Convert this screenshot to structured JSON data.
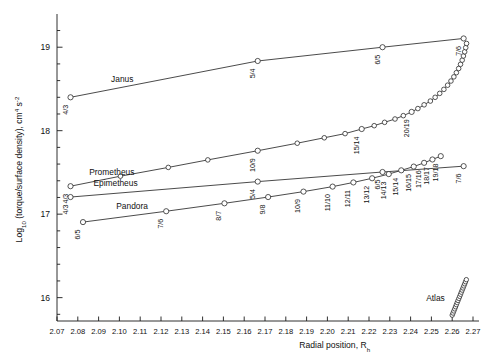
{
  "chart_data": {
    "type": "line",
    "title": "",
    "xlabel": "Radial position, R",
    "xlabel_sub": "h",
    "ylabel_main": "Log",
    "ylabel_sub": "10",
    "ylabel_rest": " (torque/surface density), cm",
    "ylabel_sup1": "4",
    "ylabel_mid": " s",
    "ylabel_sup2": "-2",
    "xlim": [
      2.07,
      2.27
    ],
    "ylim": [
      15.72,
      19.35
    ],
    "xticks": [
      "2.07",
      "2.08",
      "2.09",
      "2.10",
      "2.11",
      "2.12",
      "2.13",
      "2.14",
      "2.15",
      "2.16",
      "2.17",
      "2.18",
      "2.19",
      "2.20",
      "2.21",
      "2.22",
      "2.23",
      "2.24",
      "2.25",
      "2.26",
      "2.27"
    ],
    "xtick_values": [
      2.07,
      2.08,
      2.09,
      2.1,
      2.11,
      2.12,
      2.13,
      2.14,
      2.15,
      2.16,
      2.17,
      2.18,
      2.19,
      2.2,
      2.21,
      2.22,
      2.23,
      2.24,
      2.25,
      2.26,
      2.27
    ],
    "yticks": [
      "16",
      "17",
      "18",
      "19"
    ],
    "ytick_values": [
      16,
      17,
      18,
      19
    ],
    "yminor_values": [
      15.8,
      16.2,
      16.4,
      16.6,
      16.8,
      17.2,
      17.4,
      17.6,
      17.8,
      18.2,
      18.4,
      18.6,
      18.8,
      19.2
    ],
    "grid": false,
    "legend": "none",
    "series": [
      {
        "name": "Janus",
        "label_x": 2.096,
        "label_y": 18.58,
        "points": [
          {
            "x": 2.0765,
            "y": 18.4,
            "label": "4/3"
          },
          {
            "x": 2.1665,
            "y": 18.835,
            "label": "5/4"
          },
          {
            "x": 2.2265,
            "y": 19.0,
            "label": "6/5"
          },
          {
            "x": 2.2655,
            "y": 19.105,
            "label": "7/6"
          }
        ]
      },
      {
        "name": "Prometheus",
        "label_x": 2.0855,
        "label_y": 17.475,
        "points": [
          {
            "x": 2.0765,
            "y": 17.335,
            "label": "4/3"
          },
          {
            "x": 2.1005,
            "y": 17.455,
            "label": ""
          },
          {
            "x": 2.1235,
            "y": 17.56,
            "label": ""
          },
          {
            "x": 2.1425,
            "y": 17.65,
            "label": ""
          },
          {
            "x": 2.1665,
            "y": 17.76,
            "label": "10/9"
          },
          {
            "x": 2.1855,
            "y": 17.85,
            "label": ""
          },
          {
            "x": 2.1985,
            "y": 17.915,
            "label": ""
          },
          {
            "x": 2.2085,
            "y": 17.965,
            "label": ""
          },
          {
            "x": 2.2165,
            "y": 18.02,
            "label": "15/14"
          },
          {
            "x": 2.2225,
            "y": 18.06,
            "label": ""
          },
          {
            "x": 2.2275,
            "y": 18.1,
            "label": ""
          },
          {
            "x": 2.2325,
            "y": 18.14,
            "label": ""
          },
          {
            "x": 2.2365,
            "y": 18.18,
            "label": ""
          },
          {
            "x": 2.2405,
            "y": 18.225,
            "label": "20/19"
          },
          {
            "x": 2.2435,
            "y": 18.265,
            "label": ""
          },
          {
            "x": 2.2465,
            "y": 18.31,
            "label": ""
          },
          {
            "x": 2.2495,
            "y": 18.355,
            "label": ""
          },
          {
            "x": 2.2518,
            "y": 18.4,
            "label": ""
          },
          {
            "x": 2.254,
            "y": 18.447,
            "label": ""
          },
          {
            "x": 2.256,
            "y": 18.495,
            "label": ""
          },
          {
            "x": 2.2578,
            "y": 18.545,
            "label": ""
          },
          {
            "x": 2.2594,
            "y": 18.595,
            "label": ""
          },
          {
            "x": 2.2608,
            "y": 18.645,
            "label": ""
          },
          {
            "x": 2.262,
            "y": 18.695,
            "label": ""
          },
          {
            "x": 2.2631,
            "y": 18.745,
            "label": ""
          },
          {
            "x": 2.264,
            "y": 18.795,
            "label": ""
          },
          {
            "x": 2.2648,
            "y": 18.845,
            "label": ""
          },
          {
            "x": 2.2654,
            "y": 18.895,
            "label": ""
          },
          {
            "x": 2.266,
            "y": 18.945,
            "label": ""
          },
          {
            "x": 2.2665,
            "y": 18.995,
            "label": ""
          },
          {
            "x": 2.2669,
            "y": 19.045,
            "label": ""
          }
        ]
      },
      {
        "name": "Epimetheus",
        "label_x": 2.0875,
        "label_y": 17.335,
        "points": [
          {
            "x": 2.0765,
            "y": 17.205,
            "label": "4/3"
          },
          {
            "x": 2.1665,
            "y": 17.39,
            "label": "5/4"
          },
          {
            "x": 2.2265,
            "y": 17.505,
            "label": "6/5"
          },
          {
            "x": 2.2655,
            "y": 17.575,
            "label": "7/6"
          }
        ]
      },
      {
        "name": "Pandora",
        "label_x": 2.0985,
        "label_y": 17.065,
        "points": [
          {
            "x": 2.0825,
            "y": 16.905,
            "label": "6/5"
          },
          {
            "x": 2.1225,
            "y": 17.035,
            "label": "7/6"
          },
          {
            "x": 2.1505,
            "y": 17.13,
            "label": "8/7"
          },
          {
            "x": 2.1715,
            "y": 17.205,
            "label": "9/8"
          },
          {
            "x": 2.1885,
            "y": 17.27,
            "label": "10/9"
          },
          {
            "x": 2.2025,
            "y": 17.33,
            "label": "11/10"
          },
          {
            "x": 2.2125,
            "y": 17.38,
            "label": "12/11"
          },
          {
            "x": 2.2215,
            "y": 17.43,
            "label": "13/12"
          },
          {
            "x": 2.2295,
            "y": 17.48,
            "label": "14/13"
          },
          {
            "x": 2.2355,
            "y": 17.525,
            "label": "15/14"
          },
          {
            "x": 2.2415,
            "y": 17.57,
            "label": "16/15"
          },
          {
            "x": 2.2465,
            "y": 17.615,
            "label": "17/16"
          },
          {
            "x": 2.2505,
            "y": 17.655,
            "label": "18/17"
          },
          {
            "x": 2.2545,
            "y": 17.695,
            "label": "19/18"
          }
        ]
      },
      {
        "name": "Atlas",
        "label_x": 2.2475,
        "label_y": 15.96,
        "points": [
          {
            "x": 2.26,
            "y": 15.79,
            "label": ""
          },
          {
            "x": 2.2604,
            "y": 15.815,
            "label": ""
          },
          {
            "x": 2.2608,
            "y": 15.84,
            "label": ""
          },
          {
            "x": 2.2612,
            "y": 15.865,
            "label": ""
          },
          {
            "x": 2.2616,
            "y": 15.89,
            "label": ""
          },
          {
            "x": 2.262,
            "y": 15.915,
            "label": ""
          },
          {
            "x": 2.2624,
            "y": 15.94,
            "label": ""
          },
          {
            "x": 2.2628,
            "y": 15.965,
            "label": ""
          },
          {
            "x": 2.2632,
            "y": 15.99,
            "label": ""
          },
          {
            "x": 2.2636,
            "y": 16.015,
            "label": ""
          },
          {
            "x": 2.264,
            "y": 16.04,
            "label": ""
          },
          {
            "x": 2.2644,
            "y": 16.065,
            "label": ""
          },
          {
            "x": 2.2648,
            "y": 16.09,
            "label": ""
          },
          {
            "x": 2.2652,
            "y": 16.115,
            "label": ""
          },
          {
            "x": 2.2656,
            "y": 16.14,
            "label": ""
          },
          {
            "x": 2.266,
            "y": 16.165,
            "label": ""
          },
          {
            "x": 2.2664,
            "y": 16.19,
            "label": ""
          },
          {
            "x": 2.2668,
            "y": 16.215,
            "label": ""
          }
        ]
      }
    ]
  },
  "colors": {
    "axis": "#1a1a1a",
    "curve": "#2b2b2b",
    "marker_fill": "#ffffff",
    "background": "#ffffff"
  }
}
